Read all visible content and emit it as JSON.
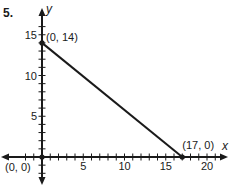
{
  "problem_number": "5.",
  "chart_data": {
    "type": "line",
    "title": "",
    "xlabel": "x",
    "ylabel": "y",
    "xlim": [
      -3,
      22
    ],
    "ylim": [
      -3,
      17
    ],
    "grid": false,
    "x_ticks": [
      5,
      10,
      15,
      20
    ],
    "y_ticks": [
      5,
      10,
      15
    ],
    "x_minor_step": 1,
    "y_minor_step": 1,
    "series": [
      {
        "name": "line",
        "x": [
          0,
          17
        ],
        "y": [
          14,
          0
        ]
      }
    ],
    "points": [
      {
        "x": 0,
        "y": 14,
        "label": "(0, 14)"
      },
      {
        "x": 17,
        "y": 0,
        "label": "(17, 0)"
      },
      {
        "x": 0,
        "y": 0,
        "label": "(0, 0)"
      }
    ],
    "colors": {
      "line": "#1a1a1a",
      "axes": "#1a1a1a",
      "text": "#1a1a1a"
    }
  }
}
